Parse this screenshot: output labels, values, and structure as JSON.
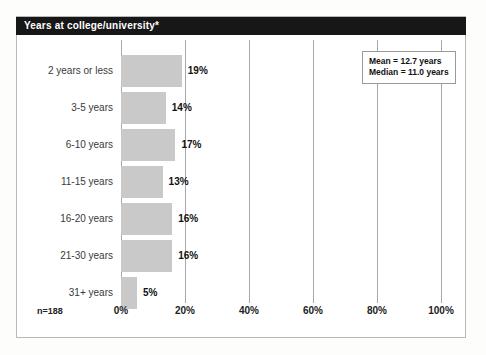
{
  "panel": {
    "title": "Years at college/university*",
    "sample_size_label": "n=188"
  },
  "stats_box": {
    "mean_label": "Mean = 12.7 years",
    "median_label": "Median = 11.0 years"
  },
  "chart_data": {
    "type": "bar",
    "orientation": "horizontal",
    "title": "Years at college/university*",
    "xlabel": "",
    "ylabel": "",
    "xlim": [
      0,
      100
    ],
    "xticks": [
      0,
      20,
      40,
      60,
      80,
      100
    ],
    "xtick_labels": [
      "0%",
      "20%",
      "40%",
      "60%",
      "80%",
      "100%"
    ],
    "grid": true,
    "legend": false,
    "bar_color": "#c9c9c9",
    "categories": [
      "2 years or less",
      "3-5 years",
      "6-10 years",
      "11-15 years",
      "16-20 years",
      "21-30 years",
      "31+ years"
    ],
    "values": [
      19,
      14,
      17,
      13,
      16,
      16,
      5
    ],
    "value_labels": [
      "19%",
      "14%",
      "17%",
      "13%",
      "16%",
      "16%",
      "5%"
    ],
    "annotations": [
      "Mean = 12.7 years",
      "Median = 11.0 years",
      "n=188"
    ],
    "n": 188,
    "mean": 12.7,
    "median": 11.0
  }
}
